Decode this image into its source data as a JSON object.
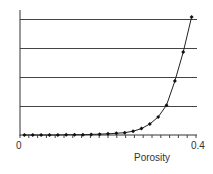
{
  "chart_data": {
    "type": "line",
    "title": "",
    "xlabel": "Porosity",
    "ylabel": "",
    "xlim": [
      0,
      0.4
    ],
    "ylim": [
      0,
      4.2
    ],
    "x_tick_labels": [
      "0",
      "0.4"
    ],
    "y_gridlines": [
      1,
      2,
      3,
      4
    ],
    "grid": true,
    "legend": null,
    "series": [
      {
        "name": "curve",
        "marker": "diamond",
        "x": [
          0.01,
          0.029,
          0.048,
          0.067,
          0.086,
          0.105,
          0.124,
          0.143,
          0.162,
          0.181,
          0.2,
          0.219,
          0.238,
          0.257,
          0.276,
          0.295,
          0.314,
          0.333,
          0.352,
          0.371,
          0.39
        ],
        "values": [
          0.0,
          0.0,
          0.0,
          0.0,
          0.0,
          0.01,
          0.01,
          0.01,
          0.02,
          0.03,
          0.04,
          0.06,
          0.08,
          0.13,
          0.22,
          0.38,
          0.62,
          1.03,
          1.86,
          2.86,
          4.07
        ]
      }
    ]
  },
  "labels": {
    "x_min": "0",
    "x_max": "0.4",
    "x_title": "Porosity"
  }
}
